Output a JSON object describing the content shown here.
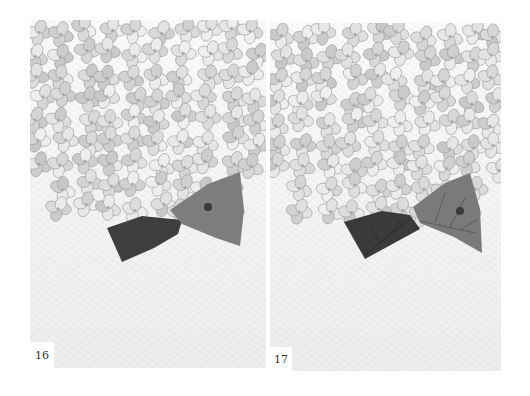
{
  "spread": {
    "subject": "Hydrangea watercolor illustration, step-by-step",
    "pages": [
      {
        "page_number": "16",
        "step": "Dark leaf painted, lighter leaf with wash"
      },
      {
        "page_number": "17",
        "step": "Veins added to both leaves"
      }
    ]
  },
  "colors": {
    "paper": "#f4f4f4",
    "petal": "#e4e4e4",
    "petal_shade": "#9a9a9a",
    "leaf_dark": "#3c3c3c",
    "leaf_mid": "#7a7a7a"
  }
}
